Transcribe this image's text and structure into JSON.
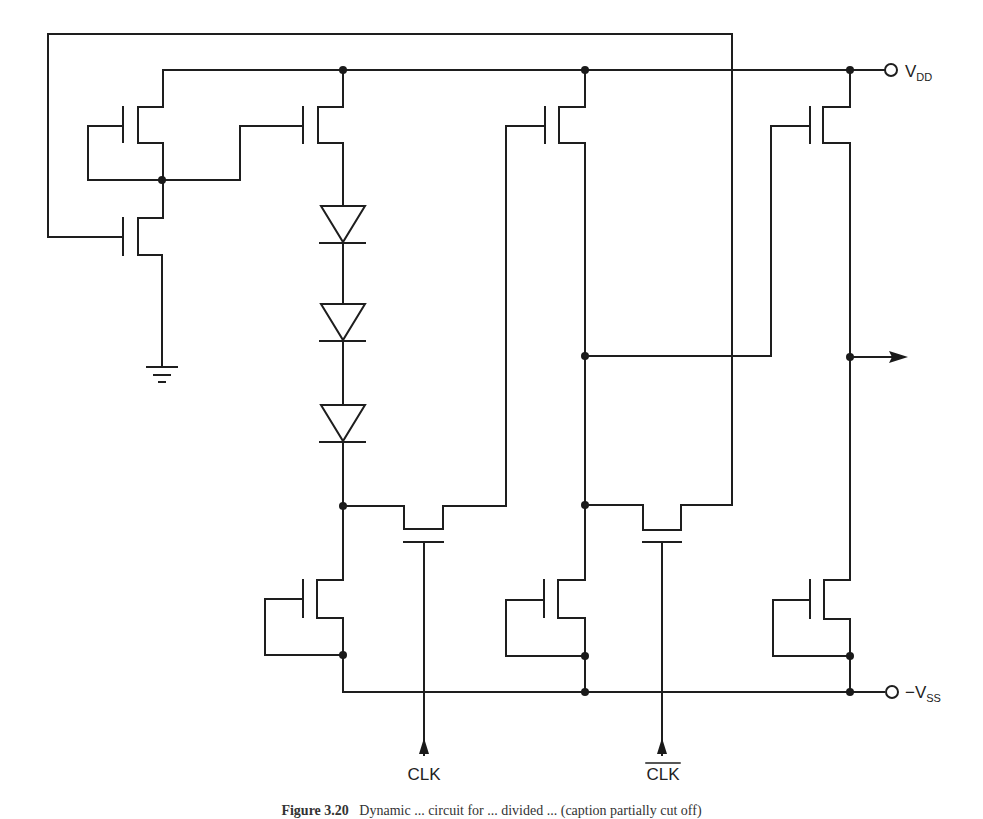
{
  "figure": {
    "type": "circuit-schematic",
    "caption_label": "Figure 3.20",
    "caption_text": "Dynamic ... circuit for ... divided ... (caption partially cut off)"
  },
  "labels": {
    "vdd_main": "V",
    "vdd_sub": "DD",
    "vss_prefix": "−V",
    "vss_sub": "SS",
    "clk": "CLK",
    "clk_bar": "CLK"
  },
  "components": {
    "transistors": [
      {
        "id": "M1",
        "role": "load (gate-drain tied)",
        "stage": "bias"
      },
      {
        "id": "M2",
        "role": "feedback-gated",
        "stage": "bias"
      },
      {
        "id": "M3",
        "role": "pull-up",
        "stage": "stage1"
      },
      {
        "id": "M4",
        "role": "pull-up",
        "stage": "stage2"
      },
      {
        "id": "M5",
        "role": "pull-up",
        "stage": "output"
      },
      {
        "id": "M6",
        "role": "pass (CLK)",
        "stage": "stage1"
      },
      {
        "id": "M7",
        "role": "pass (CLK-bar)",
        "stage": "stage2"
      },
      {
        "id": "M8",
        "role": "load",
        "stage": "stage1"
      },
      {
        "id": "M9",
        "role": "load",
        "stage": "stage2"
      },
      {
        "id": "M10",
        "role": "load",
        "stage": "output"
      }
    ],
    "diodes": 3,
    "ground": 1,
    "terminals": [
      "VDD",
      "-VSS",
      "CLK",
      "CLK-bar",
      "output"
    ]
  }
}
